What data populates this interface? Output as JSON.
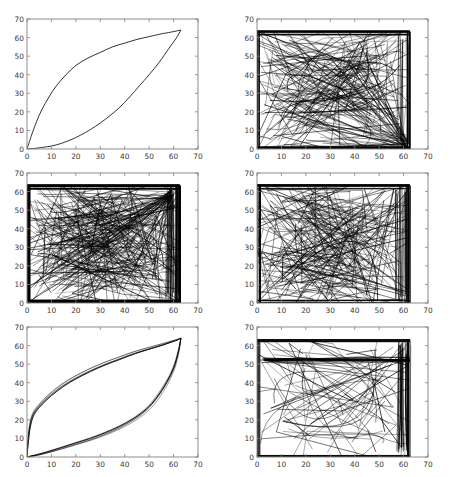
{
  "figure": {
    "title": "",
    "width": 459,
    "height": 477,
    "background": "#ffffff",
    "rows": 3,
    "cols": 2,
    "line_color": "#000000",
    "axis_color": "#808080",
    "tick_label_color": "#3a3a3a"
  },
  "chart_data": [
    {
      "type": "line",
      "id": "subplot-1",
      "position": "row1-col1",
      "title": "",
      "xlabel": "",
      "ylabel": "",
      "xlim": [
        0,
        70
      ],
      "ylim": [
        0,
        70
      ],
      "xticks": [
        0,
        10,
        20,
        30,
        40,
        50,
        60,
        70
      ],
      "yticks": [
        0,
        10,
        20,
        30,
        40,
        50,
        60,
        70
      ],
      "grid": false,
      "legend": "none",
      "n_paths": 2,
      "description": "Two smooth monotone curves forming a lens/leaf shape from (0,0) to (63,64): an upper concave curve rising steeply then flattening, and a lower convex curve rising slowly then steeply.",
      "series": [
        {
          "name": "upper-curve",
          "x": [
            0,
            1,
            2,
            4,
            6,
            9,
            12,
            16,
            20,
            25,
            30,
            35,
            40,
            45,
            50,
            55,
            58,
            61,
            63
          ],
          "y": [
            0,
            4,
            8,
            15,
            21,
            28,
            34,
            40,
            45,
            49,
            52,
            55,
            57,
            59,
            60.5,
            62,
            62.7,
            63.5,
            64
          ]
        },
        {
          "name": "lower-curve",
          "x": [
            0,
            3,
            6,
            10,
            14,
            18,
            22,
            26,
            30,
            34,
            38,
            42,
            46,
            50,
            54,
            58,
            61,
            63
          ],
          "y": [
            0,
            0.3,
            0.8,
            1.6,
            3.0,
            5.0,
            7.5,
            10.5,
            14.0,
            18.0,
            22.5,
            28.0,
            34.0,
            40.0,
            46.5,
            54.0,
            59.5,
            64
          ]
        }
      ]
    },
    {
      "type": "line",
      "id": "subplot-2",
      "position": "row1-col2",
      "title": "",
      "xlabel": "",
      "ylabel": "",
      "xlim": [
        0,
        70
      ],
      "ylim": [
        0,
        70
      ],
      "xticks": [
        0,
        10,
        20,
        30,
        40,
        50,
        60,
        70
      ],
      "yticks": [
        0,
        10,
        20,
        30,
        40,
        50,
        60,
        70
      ],
      "grid": false,
      "legend": "none",
      "n_paths": 160,
      "description": "Very dense tangle of straight-ish line segments spanning the whole box from (0,0) to (62,63); heavy dark borders along left, bottom and top edges and a dense near-vertical band near x=62.",
      "density": "very-high",
      "seed": 2
    },
    {
      "type": "line",
      "id": "subplot-3",
      "position": "row2-col1",
      "title": "",
      "xlabel": "",
      "ylabel": "",
      "xlim": [
        0,
        70
      ],
      "ylim": [
        0,
        70
      ],
      "xticks": [
        0,
        10,
        20,
        30,
        40,
        50,
        60,
        70
      ],
      "yticks": [
        0,
        10,
        20,
        30,
        40,
        50,
        60,
        70
      ],
      "grid": false,
      "legend": "none",
      "n_paths": 210,
      "description": "Extremely dense tangle, darkest of all panels; solid black frame on all four inner edges with radiating fan of lines converging near x=60 and a bright converging pencil toward the lower-right.",
      "density": "extreme",
      "seed": 3
    },
    {
      "type": "line",
      "id": "subplot-4",
      "position": "row2-col2",
      "title": "",
      "xlabel": "",
      "ylabel": "",
      "xlim": [
        0,
        70
      ],
      "ylim": [
        0,
        70
      ],
      "xticks": [
        0,
        10,
        20,
        30,
        40,
        50,
        60,
        70
      ],
      "yticks": [
        0,
        10,
        20,
        30,
        40,
        50,
        60,
        70
      ],
      "grid": false,
      "legend": "none",
      "n_paths": 190,
      "description": "Dense swirl of curved arcs bulging to the left with a lighter interior lobe; saturated black band along top, left and bottom, plus a dense vertical band around x=57-62.",
      "density": "very-high",
      "seed": 4
    },
    {
      "type": "line",
      "id": "subplot-5",
      "position": "row3-col1",
      "title": "",
      "xlabel": "",
      "ylabel": "",
      "xlim": [
        0,
        70
      ],
      "ylim": [
        0,
        70
      ],
      "xticks": [
        0,
        10,
        20,
        30,
        40,
        50,
        60,
        70
      ],
      "yticks": [
        0,
        10,
        20,
        30,
        40,
        50,
        60,
        70
      ],
      "grid": false,
      "legend": "none",
      "n_paths": 10,
      "description": "A small bundle of nearly coincident lens-shaped curves from (0,0) to (63,64); upper branch rises very steeply near x=0 then flattens, lower branch hugs the x-axis then rises sharply after x=50.",
      "series": [
        {
          "name": "upper-bundle",
          "x": [
            0,
            0.6,
            1.5,
            3,
            6,
            10,
            15,
            20,
            26,
            32,
            38,
            44,
            50,
            55,
            59,
            61.5,
            63
          ],
          "y": [
            0,
            9,
            17,
            23,
            28,
            33,
            38,
            42,
            46,
            49.5,
            52.5,
            55.5,
            58,
            60,
            61.8,
            63,
            64
          ]
        },
        {
          "name": "lower-bundle",
          "x": [
            0,
            2,
            5,
            9,
            14,
            20,
            26,
            32,
            38,
            44,
            49,
            53,
            57,
            60,
            62,
            63
          ],
          "y": [
            0,
            0.6,
            1.5,
            3,
            5,
            7.5,
            10,
            13,
            16.5,
            21,
            26,
            32,
            40,
            48,
            57,
            64
          ]
        }
      ]
    },
    {
      "type": "line",
      "id": "subplot-6",
      "position": "row3-col2",
      "title": "",
      "xlabel": "",
      "ylabel": "",
      "xlim": [
        0,
        70
      ],
      "ylim": [
        0,
        70
      ],
      "xticks": [
        0,
        10,
        20,
        30,
        40,
        50,
        60,
        70
      ],
      "yticks": [
        0,
        10,
        20,
        30,
        40,
        50,
        60,
        70
      ],
      "grid": false,
      "legend": "none",
      "n_paths": 70,
      "description": "Moderately dense set of long sweeping arcs; a flat dark bundle runs along y=62-63 across the top, a second bundle near y=52-54, a dense vertical sheaf near x=58-62 dipping to y=3, and crossing diagonals filling the interior.",
      "density": "medium-high",
      "seed": 6
    }
  ],
  "axis": {
    "xticklabels": [
      "0",
      "10",
      "20",
      "30",
      "40",
      "50",
      "60",
      "70"
    ],
    "yticklabels": [
      "0",
      "10",
      "20",
      "30",
      "40",
      "50",
      "60",
      "70"
    ]
  }
}
